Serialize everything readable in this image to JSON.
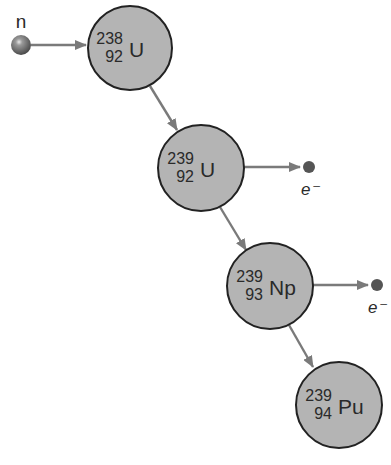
{
  "diagram": {
    "colors": {
      "nucleus_fill": "#b4b4b4",
      "nucleus_stroke": "#222222",
      "arrow": "#7a7a7a",
      "particle": "#555555",
      "text": "#2a2a2a"
    },
    "neutron": {
      "label": "n",
      "cx": 21,
      "cy": 45,
      "r": 10
    },
    "nuclei": [
      {
        "id": "u238",
        "mass": "238",
        "atomic": "92",
        "symbol": "U",
        "cx": 130,
        "cy": 48,
        "r": 42
      },
      {
        "id": "u239",
        "mass": "239",
        "atomic": "92",
        "symbol": "U",
        "cx": 201,
        "cy": 168,
        "r": 43
      },
      {
        "id": "np239",
        "mass": "239",
        "atomic": "93",
        "symbol": "Np",
        "cx": 270,
        "cy": 286,
        "r": 43
      },
      {
        "id": "pu239",
        "mass": "239",
        "atomic": "94",
        "symbol": "Pu",
        "cx": 339,
        "cy": 405,
        "r": 43
      }
    ],
    "electrons": [
      {
        "label": "e⁻",
        "cx": 309,
        "cy": 167,
        "r": 6,
        "label_x": 301,
        "label_y": 195
      },
      {
        "label": "e⁻",
        "cx": 377,
        "cy": 285,
        "r": 6,
        "label_x": 368,
        "label_y": 313
      }
    ],
    "arrows": [
      {
        "from": "neutron",
        "to": "u238",
        "x1": 31,
        "y1": 45,
        "x2": 86,
        "y2": 45
      },
      {
        "from": "u238",
        "to": "u239",
        "x1": 150,
        "y1": 86,
        "x2": 177,
        "y2": 130
      },
      {
        "from": "u239",
        "to": "electron-1",
        "x1": 244,
        "y1": 167,
        "x2": 300,
        "y2": 167
      },
      {
        "from": "u239",
        "to": "np239",
        "x1": 220,
        "y1": 207,
        "x2": 246,
        "y2": 250
      },
      {
        "from": "np239",
        "to": "electron-2",
        "x1": 313,
        "y1": 285,
        "x2": 368,
        "y2": 285
      },
      {
        "from": "np239",
        "to": "pu239",
        "x1": 289,
        "y1": 325,
        "x2": 313,
        "y2": 367
      }
    ]
  }
}
